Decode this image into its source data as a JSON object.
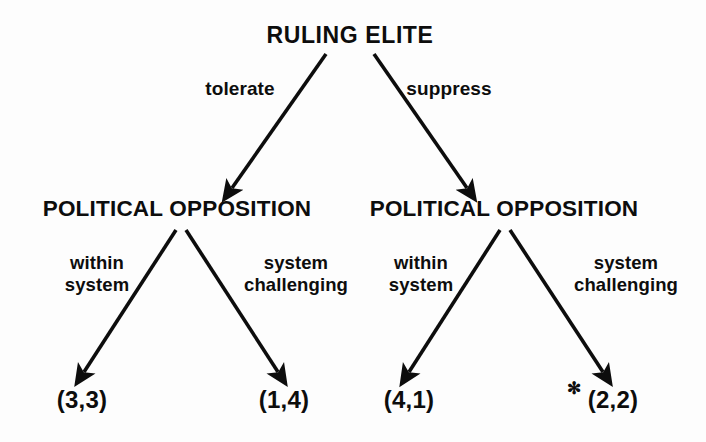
{
  "diagram": {
    "type": "extensive-form-game-tree",
    "background_color": "#fdfdfd",
    "ink_color": "#0d0d0d",
    "root": {
      "label": "RULING ELITE",
      "x": 350,
      "y": 35
    },
    "players": [
      {
        "id": "opposition-left",
        "label": "POLITICAL OPPOSITION",
        "x": 177,
        "y": 209
      },
      {
        "id": "opposition-right",
        "label": "POLITICAL OPPOSITION",
        "x": 504,
        "y": 209
      }
    ],
    "edge_labels": [
      {
        "id": "tolerate",
        "text": "tolerate",
        "lines": [
          "tolerate"
        ],
        "x": 240,
        "y": 89
      },
      {
        "id": "suppress",
        "text": "suppress",
        "lines": [
          "suppress"
        ],
        "x": 449,
        "y": 89
      },
      {
        "id": "within-system-left",
        "text": "within system",
        "lines": [
          "within",
          "system"
        ],
        "x": 97,
        "y": 274
      },
      {
        "id": "system-challenging-left",
        "text": "system challenging",
        "lines": [
          "system",
          "challenging"
        ],
        "x": 296,
        "y": 274
      },
      {
        "id": "within-system-right",
        "text": "within system",
        "lines": [
          "within",
          "system"
        ],
        "x": 421,
        "y": 274
      },
      {
        "id": "system-challenging-right",
        "text": "system challenging",
        "lines": [
          "system",
          "challenging"
        ],
        "x": 626,
        "y": 274
      }
    ],
    "outcomes": [
      {
        "id": "outcome-3-3",
        "label": "(3,3)",
        "payoffs": [
          3,
          3
        ],
        "x": 82,
        "y": 400,
        "starred": false
      },
      {
        "id": "outcome-1-4",
        "label": "(1,4)",
        "payoffs": [
          1,
          4
        ],
        "x": 284,
        "y": 400,
        "starred": false
      },
      {
        "id": "outcome-4-1",
        "label": "(4,1)",
        "payoffs": [
          4,
          1
        ],
        "x": 409,
        "y": 400,
        "starred": false
      },
      {
        "id": "outcome-2-2",
        "label": "(2,2)",
        "payoffs": [
          2,
          2
        ],
        "x": 613,
        "y": 400,
        "starred": true
      }
    ],
    "star_annotation": {
      "glyph": "✻",
      "x": 574,
      "y": 388
    },
    "arrows": [
      {
        "id": "arrow-tolerate",
        "from": [
          326,
          54
        ],
        "to": [
          232,
          188
        ]
      },
      {
        "id": "arrow-suppress",
        "from": [
          374,
          54
        ],
        "to": [
          467,
          188
        ]
      },
      {
        "id": "arrow-within-system-left",
        "from": [
          176,
          230
        ],
        "to": [
          84,
          372
        ]
      },
      {
        "id": "arrow-system-challenging-left",
        "from": [
          186,
          230
        ],
        "to": [
          278,
          372
        ]
      },
      {
        "id": "arrow-within-system-right",
        "from": [
          500,
          230
        ],
        "to": [
          409,
          372
        ]
      },
      {
        "id": "arrow-system-challenging-right",
        "from": [
          510,
          230
        ],
        "to": [
          603,
          372
        ]
      }
    ]
  }
}
